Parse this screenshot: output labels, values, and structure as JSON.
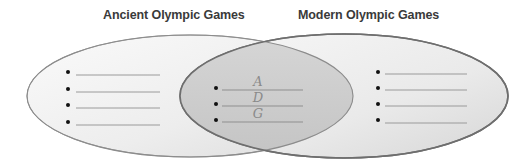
{
  "diagram": {
    "type": "venn",
    "sets": [
      {
        "id": "left",
        "title": "Ancient Olympic Games",
        "items": [
          "",
          "",
          "",
          ""
        ]
      },
      {
        "id": "right",
        "title": "Modern Olympic Games",
        "items": [
          "",
          "",
          "",
          ""
        ]
      }
    ],
    "intersection": {
      "items": [
        "A",
        "D",
        "G"
      ]
    },
    "colors": {
      "ellipse_fill_light": "#f3f3f3",
      "ellipse_fill_dark": "#d9d9d9",
      "overlap_fill": "#cfcfcf",
      "outline": "#8c8c8c",
      "line": "#9a9a9a",
      "bullet": "#111111",
      "title_text": "#3a3a3a",
      "handwriting": "#8a8a8a"
    }
  }
}
